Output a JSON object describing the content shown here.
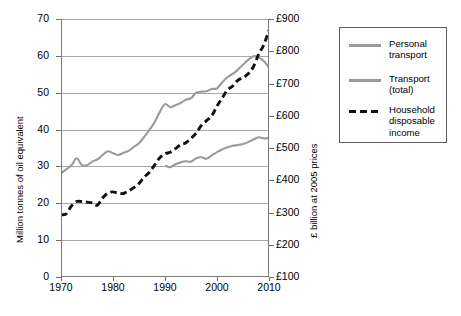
{
  "chart_data": {
    "type": "line",
    "title": "",
    "xlabel": "",
    "ylabel": "Million tonnes of oil equivalent",
    "ylabel_right": "£ billion at 2005 prices",
    "xlim": [
      1970,
      2010
    ],
    "ylim": [
      0,
      70
    ],
    "ylim_right": [
      100,
      900
    ],
    "grid": true,
    "legend_position": "right",
    "xticks": [
      "1970",
      "1980",
      "1990",
      "2000",
      "2010"
    ],
    "xtick_values": [
      1970,
      1980,
      1990,
      2000,
      2010
    ],
    "yticks": [
      "0",
      "10",
      "20",
      "30",
      "40",
      "50",
      "60",
      "70"
    ],
    "ytick_values": [
      0,
      10,
      20,
      30,
      40,
      50,
      60,
      70
    ],
    "yticks_right": [
      "£100",
      "£200",
      "£300",
      "£400",
      "£500",
      "£600",
      "£700",
      "£800",
      "£900"
    ],
    "ytick_values_right": [
      100,
      200,
      300,
      400,
      500,
      600,
      700,
      800,
      900
    ],
    "series": [
      {
        "name": "Personal transport",
        "axis": "left",
        "style": "solid",
        "color": "#9a9a9a",
        "x": [
          1990,
          1991,
          1992,
          1993,
          1994,
          1995,
          1996,
          1997,
          1998,
          1999,
          2000,
          2001,
          2002,
          2003,
          2004,
          2005,
          2006,
          2007,
          2008,
          2009,
          2010
        ],
        "values": [
          30.2,
          29.8,
          30.6,
          31.1,
          31.4,
          31.3,
          32.2,
          32.5,
          32.1,
          33.0,
          33.9,
          34.6,
          35.2,
          35.6,
          35.8,
          36.1,
          36.6,
          37.3,
          37.9,
          37.6,
          37.7
        ]
      },
      {
        "name": "Transport (total)",
        "axis": "left",
        "style": "solid",
        "color": "#9a9a9a",
        "x": [
          1970,
          1971,
          1972,
          1973,
          1974,
          1975,
          1976,
          1977,
          1978,
          1979,
          1980,
          1981,
          1982,
          1983,
          1984,
          1985,
          1986,
          1987,
          1988,
          1989,
          1990,
          1991,
          1992,
          1993,
          1994,
          1995,
          1996,
          1997,
          1998,
          1999,
          2000,
          2001,
          2002,
          2003,
          2004,
          2005,
          2006,
          2007,
          2008,
          2009,
          2010
        ],
        "values": [
          28.1,
          29.2,
          30.3,
          32.2,
          30.4,
          30.3,
          31.3,
          31.9,
          33.1,
          34.1,
          33.6,
          33.1,
          33.7,
          34.2,
          35.3,
          36.3,
          38.0,
          39.9,
          42.0,
          44.8,
          46.9,
          46.1,
          46.6,
          47.2,
          48.1,
          48.5,
          50.0,
          50.3,
          50.4,
          51.0,
          51.2,
          52.8,
          54.2,
          55.1,
          56.2,
          57.6,
          58.9,
          59.9,
          59.6,
          58.6,
          56.8
        ]
      },
      {
        "name": "Household disposable income",
        "axis": "right",
        "style": "dashed",
        "color": "#111111",
        "x": [
          1970,
          1971,
          1972,
          1973,
          1974,
          1975,
          1976,
          1977,
          1978,
          1979,
          1980,
          1981,
          1982,
          1983,
          1984,
          1985,
          1986,
          1987,
          1988,
          1989,
          1990,
          1991,
          1992,
          1993,
          1994,
          1995,
          1996,
          1997,
          1998,
          1999,
          2000,
          2001,
          2002,
          2003,
          2004,
          2005,
          2006,
          2007,
          2008,
          2009,
          2010
        ],
        "values": [
          293,
          296,
          320,
          334,
          334,
          332,
          330,
          323,
          345,
          360,
          364,
          360,
          359,
          367,
          377,
          390,
          410,
          425,
          447,
          470,
          482,
          487,
          498,
          510,
          516,
          530,
          546,
          570,
          585,
          600,
          630,
          655,
          680,
          692,
          710,
          718,
          730,
          752,
          790,
          820,
          865
        ]
      }
    ]
  },
  "legend": {
    "items": [
      {
        "label_line1": "Personal",
        "label_line2": "transport",
        "label_line3": "",
        "style": "solid"
      },
      {
        "label_line1": "Transport",
        "label_line2": "(total)",
        "label_line3": "",
        "style": "solid"
      },
      {
        "label_line1": "Household",
        "label_line2": "disposable",
        "label_line3": "income",
        "style": "dashed"
      }
    ]
  },
  "colors": {
    "gray_line": "#9a9a9a",
    "dashed_line": "#111111",
    "gridline": "#a8a8a8",
    "axis": "#7b7b7b"
  }
}
